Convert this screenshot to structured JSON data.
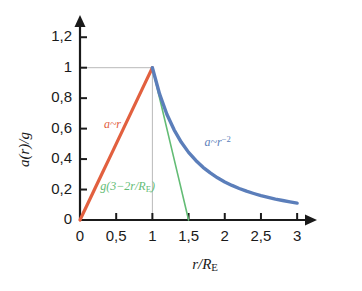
{
  "chart_data": {
    "type": "line",
    "title": "",
    "xlabel": "r/R_E",
    "ylabel": "a(r)/g",
    "xlim": [
      0,
      3.15
    ],
    "ylim": [
      0,
      1.3
    ],
    "grid": "reference lines at x=1 and y=1 only",
    "legend": "inline curve annotations",
    "x_ticks": [
      0,
      0.5,
      1,
      1.5,
      2,
      2.5,
      3
    ],
    "x_tick_labels": [
      "0",
      "0,5",
      "1",
      "1,5",
      "2",
      "2,5",
      "3"
    ],
    "y_ticks": [
      0,
      0.2,
      0.4,
      0.6,
      0.8,
      1.0,
      1.2
    ],
    "y_tick_labels": [
      "0",
      "0,2",
      "0,4",
      "0,6",
      "0,8",
      "1",
      "1,2"
    ],
    "series": [
      {
        "name": "a~r",
        "color": "#E2603F",
        "label": "a~r",
        "label_x": 0.33,
        "label_y": 0.62,
        "description": "linear interior solution",
        "x": [
          0,
          0.1,
          0.2,
          0.3,
          0.4,
          0.5,
          0.6,
          0.7,
          0.8,
          0.9,
          1.0
        ],
        "values": [
          0,
          0.1,
          0.2,
          0.3,
          0.4,
          0.5,
          0.6,
          0.7,
          0.8,
          0.9,
          1.0
        ]
      },
      {
        "name": "a~r^-2",
        "color": "#5B7EBA",
        "label": "a~r",
        "label_exponent": "−2",
        "label_x": 1.72,
        "label_y": 0.505,
        "description": "inverse-square exterior solution",
        "x": [
          1.0,
          1.1,
          1.2,
          1.3,
          1.4,
          1.5,
          1.6,
          1.7,
          1.8,
          1.9,
          2.0,
          2.1,
          2.2,
          2.3,
          2.4,
          2.5,
          2.6,
          2.7,
          2.8,
          2.9,
          3.0
        ],
        "values": [
          1.0,
          0.826,
          0.694,
          0.592,
          0.51,
          0.444,
          0.391,
          0.346,
          0.309,
          0.277,
          0.25,
          0.227,
          0.207,
          0.189,
          0.174,
          0.16,
          0.148,
          0.137,
          0.128,
          0.119,
          0.111
        ]
      },
      {
        "name": "g(3-2r/RE)",
        "color": "#63BC75",
        "label_prefix": "g(3−2r/R",
        "label_sub": "E",
        "label_suffix": ")",
        "label_x": 0.28,
        "label_y": 0.21,
        "description": "linear decline reaching zero at r=1.5",
        "x": [
          1.0,
          1.125,
          1.25,
          1.375,
          1.5
        ],
        "values": [
          1.0,
          0.75,
          0.5,
          0.25,
          0.0
        ]
      }
    ],
    "reference_lines": [
      {
        "name": "y-one-gridline",
        "orientation": "horizontal",
        "value": 1.0,
        "from_x": 0,
        "to_x": 1.0,
        "color": "#b9b9b9"
      },
      {
        "name": "x-one-gridline",
        "orientation": "vertical",
        "value": 1.0,
        "from_y": 0,
        "to_y": 1.0,
        "color": "#b9b9b9"
      }
    ],
    "axis_color": "#1a1a1a"
  }
}
